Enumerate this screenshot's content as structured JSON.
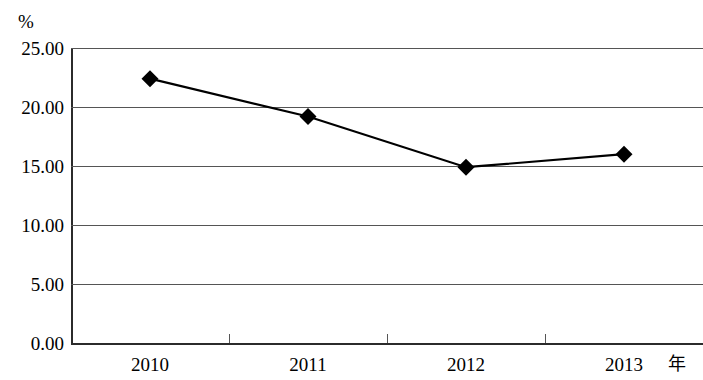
{
  "chart_data": {
    "type": "line",
    "title": "",
    "subtitle": "",
    "xlabel": "年",
    "ylabel": "%",
    "categories": [
      "2010",
      "2011",
      "2012",
      "2013"
    ],
    "series": [
      {
        "name": "",
        "values": [
          22.4,
          19.2,
          14.9,
          16.0
        ],
        "marker": "diamond",
        "color": "#000000"
      }
    ],
    "ylim": [
      0.0,
      25.0
    ],
    "y_ticks": [
      0.0,
      5.0,
      10.0,
      15.0,
      20.0,
      25.0
    ],
    "y_tick_labels": [
      "0.00",
      "5.00",
      "10.00",
      "15.00",
      "20.00",
      "25.00"
    ],
    "x_tick_labels": [
      "2010",
      "2011",
      "2012",
      "2013"
    ],
    "grid": true,
    "grid_axis": "y",
    "legend": false,
    "legend_position": "none",
    "annotations": []
  },
  "axes": {
    "y_unit": "%",
    "x_unit": "年"
  },
  "colors": {
    "line": "#000000",
    "marker": "#000000",
    "grid": "#555555",
    "axis": "#2b2b2b",
    "background": "#ffffff"
  }
}
